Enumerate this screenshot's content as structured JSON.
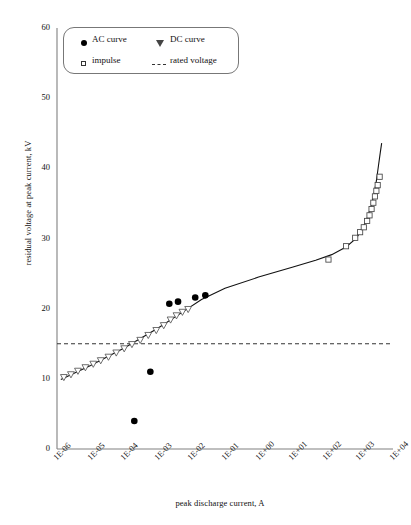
{
  "chart_data": {
    "type": "scatter",
    "title": "",
    "xlabel": "peak discharge current, A",
    "ylabel": "residual voltage at peak current, kV",
    "xscale": "log",
    "xlim": [
      1e-06,
      10000.0
    ],
    "ylim": [
      0,
      60
    ],
    "yticks": [
      0,
      10,
      20,
      30,
      40,
      50,
      60
    ],
    "xticks": [
      "1E-06",
      "1E-05",
      "1E-04",
      "1E-03",
      "1E-02",
      "1E-01",
      "1E+00",
      "1E+01",
      "1E+02",
      "1E+03",
      "1E+04"
    ],
    "grid": false,
    "legend_position": "top-left",
    "series": [
      {
        "name": "AC curve",
        "marker": "filled-circle",
        "points": [
          {
            "x": 0.0002,
            "y": 4.0
          },
          {
            "x": 0.0006,
            "y": 11.0
          },
          {
            "x": 0.0022,
            "y": 20.7
          },
          {
            "x": 0.004,
            "y": 21.0
          },
          {
            "x": 0.013,
            "y": 21.6
          },
          {
            "x": 0.026,
            "y": 21.9
          }
        ]
      },
      {
        "name": "DC curve",
        "marker": "open-triangle-down",
        "points": [
          {
            "x": 1.6e-06,
            "y": 10.2
          },
          {
            "x": 2.6e-06,
            "y": 10.6
          },
          {
            "x": 4.2e-06,
            "y": 11.1
          },
          {
            "x": 7e-06,
            "y": 11.6
          },
          {
            "x": 1.2e-05,
            "y": 12.1
          },
          {
            "x": 2e-05,
            "y": 12.6
          },
          {
            "x": 3.4e-05,
            "y": 13.1
          },
          {
            "x": 5.8e-05,
            "y": 13.7
          },
          {
            "x": 0.0001,
            "y": 14.3
          },
          {
            "x": 0.00017,
            "y": 14.9
          },
          {
            "x": 0.0003,
            "y": 15.5
          },
          {
            "x": 0.00052,
            "y": 16.2
          },
          {
            "x": 0.0009,
            "y": 16.9
          },
          {
            "x": 0.0015,
            "y": 17.6
          },
          {
            "x": 0.0024,
            "y": 18.4
          },
          {
            "x": 0.0036,
            "y": 19.0
          },
          {
            "x": 0.0054,
            "y": 19.5
          },
          {
            "x": 0.008,
            "y": 19.9
          }
        ]
      },
      {
        "name": "impulse",
        "marker": "open-square",
        "points": [
          {
            "x": 120.0,
            "y": 27.0
          },
          {
            "x": 400.0,
            "y": 28.9
          },
          {
            "x": 750.0,
            "y": 30.1
          },
          {
            "x": 1050.0,
            "y": 30.9
          },
          {
            "x": 1350.0,
            "y": 31.6
          },
          {
            "x": 1700.0,
            "y": 32.5
          },
          {
            "x": 2000.0,
            "y": 33.3
          },
          {
            "x": 2300.0,
            "y": 34.2
          },
          {
            "x": 2600.0,
            "y": 35.1
          },
          {
            "x": 2900.0,
            "y": 36.0
          },
          {
            "x": 3200.0,
            "y": 36.8
          },
          {
            "x": 3500.0,
            "y": 37.6
          },
          {
            "x": 4000.0,
            "y": 38.8
          }
        ]
      },
      {
        "name": "fitted curve",
        "marker": "line",
        "points": [
          {
            "x": 1.3e-06,
            "y": 9.9
          },
          {
            "x": 1e-05,
            "y": 11.9
          },
          {
            "x": 0.0001,
            "y": 14.4
          },
          {
            "x": 0.001,
            "y": 17.2
          },
          {
            "x": 0.005,
            "y": 19.4
          },
          {
            "x": 0.02,
            "y": 21.3
          },
          {
            "x": 0.1,
            "y": 22.9
          },
          {
            "x": 1.0,
            "y": 24.5
          },
          {
            "x": 10.0,
            "y": 25.9
          },
          {
            "x": 50.0,
            "y": 26.9
          },
          {
            "x": 150.0,
            "y": 27.7
          },
          {
            "x": 400.0,
            "y": 28.8
          },
          {
            "x": 800.0,
            "y": 30.0
          },
          {
            "x": 1200.0,
            "y": 31.3
          },
          {
            "x": 1700.0,
            "y": 32.9
          },
          {
            "x": 2200.0,
            "y": 34.5
          },
          {
            "x": 2700.0,
            "y": 36.2
          },
          {
            "x": 3200.0,
            "y": 38.2
          },
          {
            "x": 3700.0,
            "y": 40.4
          },
          {
            "x": 4200.0,
            "y": 42.3
          },
          {
            "x": 4600.0,
            "y": 43.6
          }
        ]
      },
      {
        "name": "rated voltage",
        "marker": "dashed-line",
        "value": 15.0
      }
    ]
  },
  "legend": {
    "items": [
      {
        "label": "AC curve",
        "marker": "filled-circle"
      },
      {
        "label": "DC curve",
        "marker": "open-triangle-down"
      },
      {
        "label": "impulse",
        "marker": "open-square"
      },
      {
        "label": "rated voltage",
        "marker": "dashed-line"
      }
    ]
  },
  "axes": {
    "y_title": "residual voltage at peak current, kV",
    "x_title": "peak discharge current, A"
  }
}
